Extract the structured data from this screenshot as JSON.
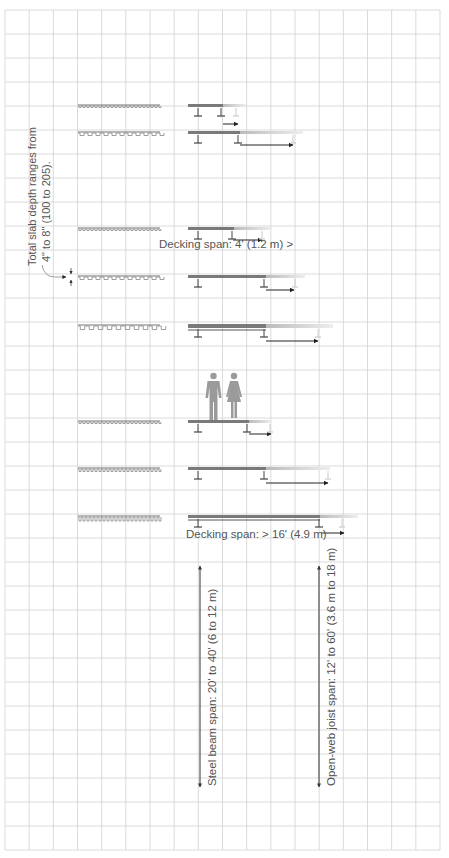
{
  "grid": {
    "x0": 5,
    "y0": 10,
    "x1": 440,
    "y1": 850,
    "cols": 18,
    "rows": 35,
    "color": "#d2d2d2"
  },
  "colors": {
    "deck": "#7a7a7a",
    "beam": "#555555",
    "light": "#cfcfcf",
    "text": "#555555",
    "arrow": "#222222",
    "figure": "#9a9a9a"
  },
  "annotations": {
    "slab_depth_line1": "Total slab depth ranges from",
    "slab_depth_line2": "4\" to 8\" (100 to 205).",
    "decking_span_min": "Decking span: 4' (1.2 m) >",
    "decking_span_max": "Decking span: > 16' (4.9 m)",
    "steel_beam_span": "Steel beam span: 20' to 40' (6 to 12 m)",
    "joist_span": "Open-web joist span: 12' to 60' (3.6 m to 18 m)"
  },
  "rows": [
    {
      "y": 105,
      "profile": "fine",
      "deck_end": 223,
      "fade_end": 246,
      "support2": 221,
      "support3": 236,
      "arrow_from": 223,
      "arrow_to": 238,
      "arrow_y": 124
    },
    {
      "y": 132,
      "profile": "wide",
      "deck_end": 240,
      "fade_end": 303,
      "support2": 238,
      "support3": 293,
      "arrow_from": 240,
      "arrow_to": 293,
      "arrow_y": 145
    },
    {
      "y": 228,
      "profile": "fine",
      "deck_end": 234,
      "fade_end": 272,
      "support2": 232,
      "support3": 262,
      "arrow_from": 233,
      "arrow_to": 262,
      "arrow_y": 240
    },
    {
      "y": 276,
      "profile": "wide",
      "deck_end": 266,
      "fade_end": 305,
      "support2": 264,
      "support3": 295,
      "arrow_from": 266,
      "arrow_to": 294,
      "arrow_y": 290
    },
    {
      "y": 325,
      "profile": "deep",
      "deck_end": 266,
      "fade_end": 333,
      "support2": 264,
      "support3": 318,
      "arrow_from": 266,
      "arrow_to": 318,
      "arrow_y": 341
    },
    {
      "y": 421,
      "profile": "fine",
      "deck_end": 249,
      "fade_end": 272,
      "support2": 247,
      "support3": 270,
      "arrow_from": 249,
      "arrow_to": 271,
      "arrow_y": 434
    },
    {
      "y": 468,
      "profile": "fine2",
      "deck_end": 266,
      "fade_end": 330,
      "support2": 264,
      "support3": 328,
      "arrow_from": 266,
      "arrow_to": 328,
      "arrow_y": 483
    },
    {
      "y": 516,
      "profile": "tall",
      "deck_end": 320,
      "fade_end": 358,
      "support2": 319,
      "support3": 342,
      "arrow_from": 321,
      "arrow_to": 344,
      "arrow_y": 533
    }
  ],
  "dimensions": {
    "steel_beam": {
      "x": 200,
      "y_top": 565,
      "y_bottom": 787
    },
    "joist": {
      "x": 319,
      "y_top": 565,
      "y_bottom": 787
    }
  }
}
